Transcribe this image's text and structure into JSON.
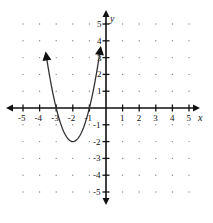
{
  "chart_data": {
    "type": "line",
    "title": "",
    "xlabel": "x",
    "ylabel": "y",
    "xlim": [
      -5,
      5
    ],
    "ylim": [
      -5,
      5
    ],
    "grid": "dotted",
    "x_ticks": [
      -5,
      -4,
      -3,
      -2,
      -1,
      1,
      2,
      3,
      4,
      5
    ],
    "y_ticks": [
      -5,
      -4,
      -3,
      -2,
      -1,
      1,
      2,
      3,
      4,
      5
    ],
    "series": [
      {
        "name": "parabola",
        "equation": "y = 2(x + 2)^2 - 2",
        "vertex": [
          -2,
          -2
        ],
        "x_intercepts": [
          -3,
          -1
        ],
        "x": [
          -3.65,
          -3.5,
          -3,
          -2.5,
          -2,
          -1.5,
          -1,
          -0.5,
          -0.35
        ],
        "y": [
          3.45,
          2.5,
          0,
          -1.5,
          -2,
          -1.5,
          0,
          2.5,
          3.45
        ],
        "arrows_at_ends": true
      }
    ],
    "colors": {
      "curve": "#333333",
      "axes": "#111111",
      "grid": "#888888"
    }
  },
  "labels": {
    "x_axis": "x",
    "y_axis": "y",
    "x_ticks": [
      "-5",
      "-4",
      "-3",
      "-2",
      "-1",
      "1",
      "2",
      "3",
      "4",
      "5"
    ],
    "y_ticks": [
      "5",
      "4",
      "3",
      "2",
      "1",
      "-1",
      "-2",
      "-3",
      "-4",
      "-5"
    ]
  }
}
